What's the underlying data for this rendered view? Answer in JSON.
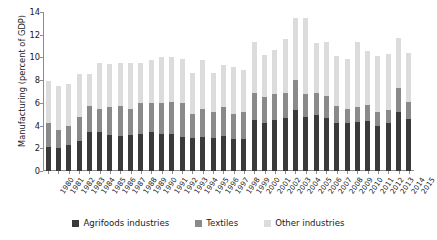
{
  "chart_data": {
    "type": "bar",
    "stacked": true,
    "title": "",
    "xlabel": "",
    "ylabel": "Manufacturing (percent of GDP)",
    "ylim": [
      0,
      14
    ],
    "yticks": [
      0,
      2,
      4,
      6,
      8,
      10,
      12,
      14
    ],
    "grid": false,
    "legend_position": "bottom",
    "categories": [
      "1980",
      "1981",
      "1982",
      "1983",
      "1984",
      "1985",
      "1986",
      "1987",
      "1988",
      "1989",
      "1990",
      "1991",
      "1992",
      "1993",
      "1994",
      "1995",
      "1996",
      "1997",
      "1998",
      "1999",
      "2000",
      "2001",
      "2002",
      "2003",
      "2004",
      "2005",
      "2006",
      "2007",
      "2008",
      "2009",
      "2010",
      "2011",
      "2012",
      "2013",
      "2014",
      "2015"
    ],
    "series": [
      {
        "name": "Agrifoods industries",
        "color": "#3a3a3a",
        "values": [
          2.1,
          2.0,
          2.3,
          2.6,
          3.4,
          3.4,
          3.2,
          3.1,
          3.2,
          3.3,
          3.4,
          3.3,
          3.3,
          3.0,
          2.9,
          3.0,
          2.9,
          3.1,
          2.8,
          2.8,
          4.5,
          4.2,
          4.5,
          4.7,
          5.4,
          4.8,
          4.9,
          4.7,
          4.2,
          4.2,
          4.3,
          4.4,
          4.0,
          4.2,
          5.2,
          4.6
        ]
      },
      {
        "name": "Textiles",
        "color": "#8a8a8a",
        "values": [
          2.1,
          1.6,
          1.7,
          2.2,
          2.3,
          2.1,
          2.4,
          2.6,
          2.3,
          2.7,
          2.6,
          2.7,
          2.8,
          3.0,
          2.1,
          2.5,
          2.3,
          2.5,
          2.2,
          2.4,
          2.4,
          2.3,
          2.3,
          2.2,
          2.6,
          2.0,
          2.0,
          1.9,
          1.5,
          1.3,
          1.3,
          1.4,
          1.2,
          1.2,
          2.1,
          1.5
        ]
      },
      {
        "name": "Other industries",
        "color": "#dcdcdc",
        "values": [
          3.7,
          3.9,
          3.7,
          3.7,
          2.8,
          4.0,
          3.8,
          3.8,
          4.0,
          3.5,
          3.8,
          4.0,
          3.9,
          3.9,
          3.6,
          4.3,
          3.4,
          3.7,
          4.2,
          3.7,
          4.5,
          3.7,
          3.9,
          4.7,
          5.5,
          6.7,
          4.4,
          4.8,
          4.4,
          4.4,
          5.8,
          4.8,
          4.9,
          4.9,
          4.4,
          4.3
        ]
      }
    ]
  },
  "legend": {
    "items": [
      {
        "label": "Agrifoods industries",
        "color": "#3a3a3a"
      },
      {
        "label": "Textiles",
        "color": "#8a8a8a"
      },
      {
        "label": "Other industries",
        "color": "#dcdcdc"
      }
    ]
  }
}
